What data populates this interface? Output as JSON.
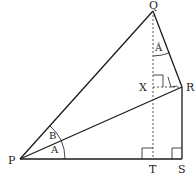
{
  "diagram": {
    "points": {
      "P": {
        "label": "P",
        "x": 20,
        "y": 159
      },
      "Q": {
        "label": "Q",
        "x": 153,
        "y": 11
      },
      "R": {
        "label": "R",
        "x": 182,
        "y": 87
      },
      "S": {
        "label": "S",
        "x": 182,
        "y": 159
      },
      "T": {
        "label": "T",
        "x": 153,
        "y": 159
      },
      "X": {
        "label": "X",
        "x": 153,
        "y": 87
      }
    },
    "angles": {
      "angle_A_at_P": "A",
      "angle_B_at_P": "B",
      "angle_A_at_Q": "Â"
    },
    "colors": {
      "stroke": "#1a1a1a",
      "dashed": "#444444"
    }
  }
}
